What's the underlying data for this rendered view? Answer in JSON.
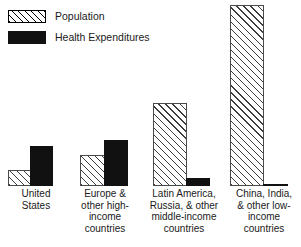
{
  "chart_data": {
    "type": "bar",
    "title": "",
    "xlabel": "",
    "ylabel": "",
    "grid": false,
    "legend_position": "top-left",
    "units": "percent of world total",
    "categories": [
      "United States",
      "Europe & other high-income countries",
      "Latin America, Russia, & other middle-income countries",
      "China, India, & other low-income countries"
    ],
    "series": [
      {
        "name": "Population",
        "values": [
          5,
          10,
          27,
          58
        ]
      },
      {
        "name": "Health Expenditures",
        "values": [
          13,
          15,
          3,
          1
        ]
      }
    ]
  },
  "legend": {
    "items": [
      {
        "label": "Population",
        "swatch": "hatched-diagonal",
        "color": "#ffffff"
      },
      {
        "label": "Health Expenditures",
        "swatch": "solid-black",
        "color": "#111111"
      }
    ]
  },
  "axis": {
    "categories": [
      {
        "lines": [
          "United",
          "States"
        ]
      },
      {
        "lines": [
          "Europe &",
          "other high-",
          "income",
          "countries"
        ]
      },
      {
        "lines": [
          "Latin America,",
          "Russia, & other",
          "middle-income",
          "countries"
        ]
      },
      {
        "lines": [
          "China, India,",
          "& other low-",
          "income",
          "countries"
        ]
      }
    ]
  },
  "bars": {
    "groups": [
      {
        "name": "united-states",
        "left": 8,
        "width": 45,
        "population": {
          "left": 0,
          "width": 23,
          "height": 16
        },
        "expenditures": {
          "left": 22,
          "width": 23,
          "height": 40
        }
      },
      {
        "name": "europe-high-income",
        "left": 80,
        "width": 48,
        "population": {
          "left": 0,
          "width": 25,
          "height": 31
        },
        "expenditures": {
          "left": 24,
          "width": 24,
          "height": 46
        }
      },
      {
        "name": "latin-america-middle-income",
        "left": 153,
        "width": 57,
        "population": {
          "left": 0,
          "width": 34,
          "height": 83
        },
        "expenditures": {
          "left": 33,
          "width": 24,
          "height": 8
        }
      },
      {
        "name": "china-india-low-income",
        "left": 230,
        "width": 58,
        "population": {
          "left": 0,
          "width": 34,
          "height": 181
        },
        "expenditures": {
          "left": 33,
          "width": 25,
          "height": 2
        }
      }
    ]
  }
}
